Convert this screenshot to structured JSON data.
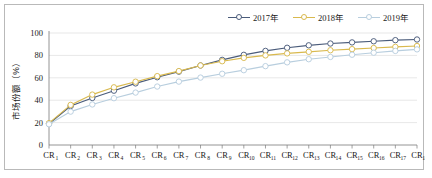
{
  "chart_data": {
    "type": "line",
    "title": "",
    "xlabel": "",
    "ylabel": "市场份额（%）",
    "ylim": [
      0,
      100
    ],
    "yticks": [
      0,
      20,
      40,
      60,
      80,
      100
    ],
    "grid": true,
    "legend_position": "top-right",
    "categories": [
      "CR1",
      "CR2",
      "CR3",
      "CR4",
      "CR5",
      "CR6",
      "CR7",
      "CR8",
      "CR9",
      "CR10",
      "CR11",
      "CR12",
      "CR13",
      "CR14",
      "CR15",
      "CR16",
      "CR17",
      "CR18"
    ],
    "category_base": "CR",
    "category_subs": [
      "1",
      "2",
      "3",
      "4",
      "5",
      "6",
      "7",
      "8",
      "9",
      "10",
      "11",
      "12",
      "13",
      "14",
      "15",
      "16",
      "17",
      "18"
    ],
    "series": [
      {
        "name": "2017年",
        "color": "#4a5b7a",
        "marker": "circle",
        "values": [
          19.0,
          34.8,
          42.0,
          48.5,
          55.0,
          60.5,
          65.5,
          71.0,
          76.0,
          80.5,
          84.0,
          86.8,
          89.0,
          90.6,
          91.6,
          92.6,
          93.6,
          94.2
        ]
      },
      {
        "name": "2018年",
        "color": "#d9b94e",
        "marker": "circle",
        "values": [
          19.5,
          35.8,
          45.0,
          51.5,
          56.5,
          61.5,
          66.0,
          71.0,
          74.8,
          77.8,
          80.0,
          81.8,
          83.2,
          84.6,
          85.6,
          86.6,
          87.6,
          88.4
        ]
      },
      {
        "name": "2019年",
        "color": "#b8cede",
        "marker": "circle",
        "values": [
          18.5,
          29.8,
          36.2,
          41.8,
          46.8,
          52.2,
          56.6,
          60.2,
          63.6,
          66.8,
          70.4,
          73.8,
          76.6,
          78.6,
          80.6,
          82.4,
          84.0,
          85.4
        ]
      }
    ]
  },
  "legend": {
    "entries": [
      {
        "label": "2017年"
      },
      {
        "label": "2018年"
      },
      {
        "label": "2019年"
      }
    ]
  }
}
